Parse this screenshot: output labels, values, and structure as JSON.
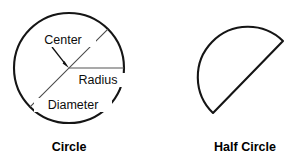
{
  "figure": {
    "background_color": "#ffffff",
    "stroke_color": "#151515",
    "text_color": "#0d0d0d",
    "shapes": [
      {
        "id": "circle",
        "caption": "Circle",
        "caption_position": {
          "x": 69,
          "y": 150
        },
        "geometry": {
          "cx": 69,
          "cy": 68,
          "r": 55
        },
        "annotations": [
          {
            "id": "center",
            "label": "Center",
            "text_anchor": "middle",
            "x": 63,
            "y": 43,
            "leader": {
              "x1": 52,
              "y1": 47,
              "x2": 67.5,
              "y2": 66.5
            }
          },
          {
            "id": "radius",
            "label": "Radius",
            "text_anchor": "middle",
            "x": 97,
            "y": 83,
            "line": {
              "x1": 69,
              "y1": 68,
              "x2": 124,
              "y2": 68
            }
          },
          {
            "id": "diameter",
            "label": "Diameter",
            "text_anchor": "middle",
            "x": 72,
            "y": 108,
            "line": {
              "x1": 30.1,
              "y1": 106.9,
              "x2": 107.9,
              "y2": 29.1
            }
          }
        ]
      },
      {
        "id": "half-circle",
        "caption": "Half Circle",
        "caption_position": {
          "x": 245,
          "y": 150
        },
        "geometry": {
          "cx": 248,
          "cy": 77,
          "r": 50,
          "diameter_start": {
            "x": 213,
            "y": 113
          },
          "diameter_end": {
            "x": 283,
            "y": 41
          },
          "rotation_deg": -46
        },
        "annotations": []
      }
    ]
  }
}
